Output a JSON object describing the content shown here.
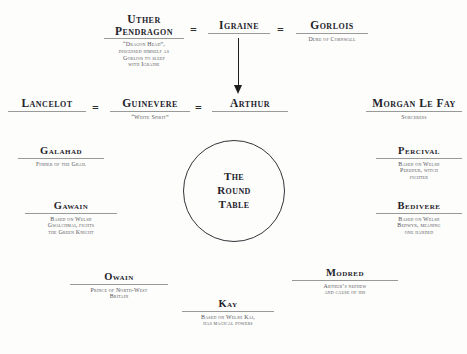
{
  "diagram": {
    "center": {
      "label": "The\nRound\nTable",
      "line1": "The",
      "line2": "Round",
      "line3": "Table"
    },
    "relations": {
      "equals": "=",
      "marriage_symbol": "="
    },
    "nodes": [
      {
        "id": "uther-pendragon",
        "name": "Uther\nPendragon",
        "name_line1": "Uther",
        "name_line2": "Pendragon",
        "desc": "“Dragon Head”,\ndisguised himself as\nGorlois to sleep\nwith Igraine",
        "desc_line1": "“Dragon Head”,",
        "desc_line2": "disguised himself as",
        "desc_line3": "Gorlois to sleep",
        "desc_line4": "with Igraine"
      },
      {
        "id": "igraine",
        "name": "Igraine",
        "desc": ""
      },
      {
        "id": "gorlois",
        "name": "Gorlois",
        "desc": "Duke of Cornwall"
      },
      {
        "id": "lancelot",
        "name": "Lancelot",
        "desc": ""
      },
      {
        "id": "guinevere",
        "name": "Guinevere",
        "desc": "“White Spirit”"
      },
      {
        "id": "arthur",
        "name": "Arthur",
        "desc": ""
      },
      {
        "id": "morgan-le-fay",
        "name": "Morgan Le Fay",
        "desc": "Sorceress"
      },
      {
        "id": "galahad",
        "name": "Galahad",
        "desc": "Finder of the Grail"
      },
      {
        "id": "percival",
        "name": "Percival",
        "desc": "Based on Welsh\nPeredur, witch\nfighter",
        "desc_line1": "Based on Welsh",
        "desc_line2": "Peredur, witch",
        "desc_line3": "fighter"
      },
      {
        "id": "gawain",
        "name": "Gawain",
        "desc": "Based on Welsh\nGwalchmai, fights\nthe Green Knight",
        "desc_line1": "Based on Welsh",
        "desc_line2": "Gwalchmai, fights",
        "desc_line3": "the Green Knight"
      },
      {
        "id": "bedivere",
        "name": "Bedivere",
        "desc": "Based on Welsh\nBedwyr, meaning\none handed",
        "desc_line1": "Based on Welsh",
        "desc_line2": "Bedwyr, meaning",
        "desc_line3": "one handed"
      },
      {
        "id": "kay",
        "name": "Kay",
        "desc": "Based on Welsh Kai,\nhas magical powers",
        "desc_line1": "Based on Welsh Kai,",
        "desc_line2": "has magical powers"
      },
      {
        "id": "owain",
        "name": "Owain",
        "desc": "Prince of North-West\nBritain",
        "desc_line1": "Prince of North-West",
        "desc_line2": "Britain"
      },
      {
        "id": "modred",
        "name": "Modred",
        "desc": "Arthur’s nephew\nand cause of his\ndownfall",
        "desc_line1": "Arthur’s nephew",
        "desc_line2": "and cause of his",
        "desc_line3": "downfall"
      }
    ],
    "colors": {
      "background": "#fdfdfb",
      "name_text": "#23232b",
      "desc_text": "#55555c",
      "rule": "#9a9a9a",
      "arrow": "#1d1d1d",
      "circle_stroke": "#33333a"
    }
  }
}
